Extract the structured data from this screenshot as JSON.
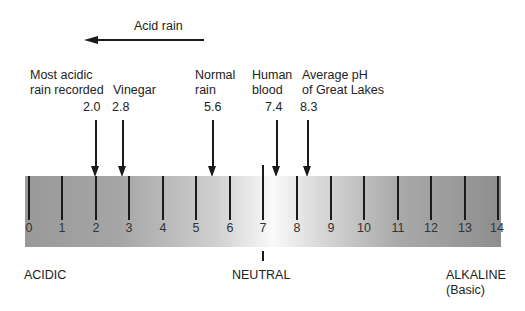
{
  "acid_rain_label": "Acid rain",
  "markers": [
    {
      "label_line1": "Most acidic",
      "label_line2": "rain recorded",
      "value": "2.0"
    },
    {
      "label_line1": "",
      "label_line2": "Vinegar",
      "value": "2.8"
    },
    {
      "label_line1": "Normal",
      "label_line2": "rain",
      "value": "5.6"
    },
    {
      "label_line1": "Human",
      "label_line2": "blood",
      "value": "7.4"
    },
    {
      "label_line1": "Average pH",
      "label_line2": "of Great Lakes",
      "value": "8.3"
    }
  ],
  "scale": {
    "min": 0,
    "max": 14,
    "ticks": [
      "0",
      "1",
      "2",
      "3",
      "4",
      "5",
      "6",
      "7",
      "8",
      "9",
      "10",
      "11",
      "12",
      "13",
      "14"
    ]
  },
  "regions": {
    "acidic": "ACIDIC",
    "neutral": "NEUTRAL",
    "alkaline": "ALKALINE",
    "alkaline_sub": "(Basic)"
  },
  "colors": {
    "bar_dark": "#8e8e8e",
    "bar_light": "#fafafa",
    "ink": "#1a1a1a"
  }
}
